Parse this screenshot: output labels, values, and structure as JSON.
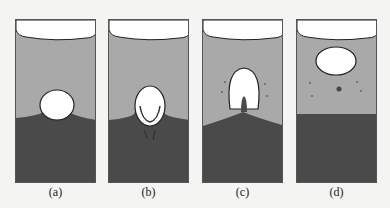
{
  "figure": {
    "colors": {
      "background": "#f4f4f2",
      "light_fluid": "#a9a9a9",
      "dark_fluid": "#4a4a4a",
      "bubble": "#ffffff",
      "outline": "#222222"
    },
    "panels": [
      {
        "label": "(a)",
        "stage": "bubble-forming-at-interface"
      },
      {
        "label": "(b)",
        "stage": "bubble-entraining-dark-film"
      },
      {
        "label": "(c)",
        "stage": "bubble-lifting-with-jet"
      },
      {
        "label": "(d)",
        "stage": "bubble-detached-with-droplets"
      }
    ]
  }
}
